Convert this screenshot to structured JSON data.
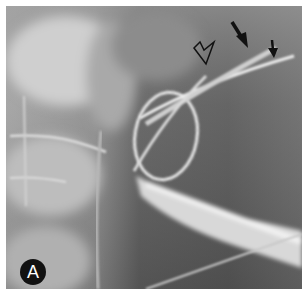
{
  "figure": {
    "panel_label": "A",
    "annotations": [
      {
        "type": "open-arrow",
        "name": "open-arrow-pointer",
        "points_to": "catheter tip crossing"
      },
      {
        "type": "solid-arrow-large",
        "name": "large-solid-arrow",
        "points_to": "upper wire segment"
      },
      {
        "type": "solid-arrow-small",
        "name": "small-solid-arrow",
        "points_to": "lower wire tip"
      }
    ],
    "colors": {
      "background_frame": "#ffffff",
      "image_dark": "#3e3e3e",
      "image_mid": "#7a7a7a",
      "bone_light": "#c8c8c8",
      "wire": "#e6e6e6",
      "arrow": "#111111",
      "label_bg": "#111111",
      "label_text": "#ffffff"
    }
  }
}
